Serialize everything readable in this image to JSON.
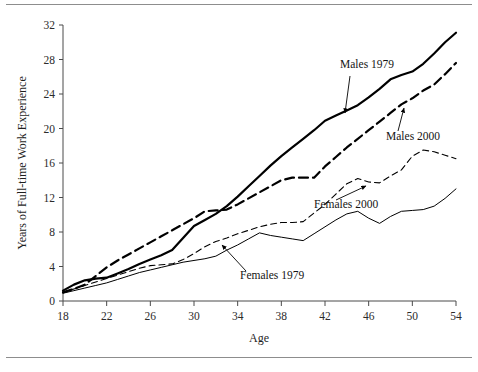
{
  "figure": {
    "background_color": "#ffffff",
    "rule_color": "#8d8d8d",
    "line_color": "#000000"
  },
  "chart_data": {
    "type": "line",
    "title": "",
    "xlabel": "Age",
    "ylabel": "Years of Full-time Work Experience",
    "xlim": [
      18,
      54
    ],
    "ylim": [
      0,
      32
    ],
    "xticks": [
      18,
      22,
      26,
      30,
      34,
      38,
      42,
      46,
      50,
      54
    ],
    "yticks": [
      0,
      4,
      8,
      12,
      16,
      20,
      24,
      28,
      32
    ],
    "grid": false,
    "legend_position": "inline-annotations",
    "x": [
      18,
      19,
      20,
      21,
      22,
      23,
      24,
      25,
      26,
      27,
      28,
      29,
      30,
      31,
      32,
      33,
      34,
      35,
      36,
      37,
      38,
      39,
      40,
      41,
      42,
      43,
      44,
      45,
      46,
      47,
      48,
      49,
      50,
      51,
      52,
      53,
      54
    ],
    "series": [
      {
        "name": "Males 1979",
        "style": "solid-thick",
        "stroke_width": 2.2,
        "dash": "none",
        "values": [
          1.2,
          1.9,
          2.4,
          2.6,
          2.7,
          3.2,
          3.7,
          4.3,
          4.8,
          5.3,
          5.9,
          7.3,
          8.7,
          9.4,
          10.1,
          11.0,
          12.1,
          13.3,
          14.5,
          15.7,
          16.8,
          17.8,
          18.8,
          19.8,
          20.9,
          21.5,
          22.1,
          22.7,
          23.6,
          24.6,
          25.7,
          26.2,
          26.6,
          27.5,
          28.7,
          30.0,
          31.1
        ]
      },
      {
        "name": "Males 2000",
        "style": "dashed-thick",
        "stroke_width": 2.2,
        "dash": "9,5",
        "values": [
          1.0,
          1.4,
          1.9,
          2.9,
          3.9,
          4.7,
          5.4,
          6.1,
          6.8,
          7.5,
          8.2,
          8.9,
          9.6,
          10.4,
          10.5,
          10.6,
          11.2,
          11.9,
          12.6,
          13.3,
          14.0,
          14.3,
          14.3,
          14.3,
          15.6,
          16.7,
          17.8,
          18.8,
          19.8,
          20.8,
          21.8,
          22.8,
          23.5,
          24.4,
          25.1,
          26.3,
          27.6
        ]
      },
      {
        "name": "Females 2000",
        "style": "dashed-thin",
        "stroke_width": 1.1,
        "dash": "6,4",
        "values": [
          1.0,
          1.4,
          1.8,
          2.2,
          2.6,
          3.0,
          3.4,
          3.8,
          4.1,
          4.2,
          4.3,
          4.8,
          5.5,
          6.3,
          6.9,
          7.3,
          7.8,
          8.2,
          8.6,
          8.9,
          9.1,
          9.1,
          9.2,
          10.2,
          11.2,
          12.4,
          13.6,
          14.2,
          13.8,
          13.7,
          14.5,
          15.2,
          16.8,
          17.5,
          17.3,
          16.9,
          16.5
        ]
      },
      {
        "name": "Females 1979",
        "style": "solid-thin",
        "stroke_width": 1.0,
        "dash": "none",
        "values": [
          0.9,
          1.2,
          1.5,
          1.8,
          2.1,
          2.5,
          2.9,
          3.3,
          3.6,
          3.9,
          4.2,
          4.5,
          4.7,
          4.9,
          5.2,
          5.9,
          6.5,
          7.2,
          7.9,
          7.6,
          7.4,
          7.2,
          7.0,
          7.8,
          8.6,
          9.4,
          10.1,
          10.4,
          9.6,
          9.0,
          9.8,
          10.4,
          10.5,
          10.6,
          11.0,
          11.9,
          13.0
        ]
      }
    ],
    "annotations": [
      {
        "label": "Males 1979",
        "text_x": 340,
        "text_y": 68,
        "arrow_from_x": 350,
        "arrow_from_y": 76,
        "arrow_to_x": 345,
        "arrow_to_y": 113
      },
      {
        "label": "Males 2000",
        "text_x": 386,
        "text_y": 140,
        "arrow_from_x": 398,
        "arrow_from_y": 131,
        "arrow_to_x": 404,
        "arrow_to_y": 108
      },
      {
        "label": "Females 2000",
        "text_x": 314,
        "text_y": 208,
        "arrow_from_x": 336,
        "arrow_from_y": 200,
        "arrow_to_x": 366,
        "arrow_to_y": 186
      },
      {
        "label": "Females 1979",
        "text_x": 240,
        "text_y": 279,
        "arrow_from_x": 246,
        "arrow_from_y": 271,
        "arrow_to_x": 222,
        "arrow_to_y": 245
      }
    ]
  }
}
